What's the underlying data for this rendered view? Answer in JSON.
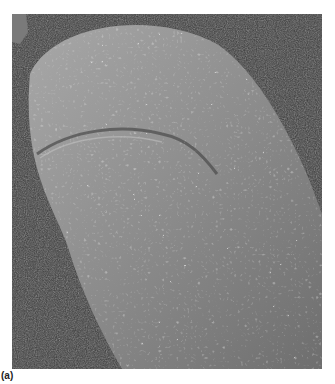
{
  "figure": {
    "colors": {
      "background": "#3a3a3a",
      "tissue_light": "#b8b8b8",
      "tissue_mid": "#8a8a8a",
      "tissue_dark": "#5a5a5a"
    }
  },
  "caption": {
    "label": "(a)"
  }
}
